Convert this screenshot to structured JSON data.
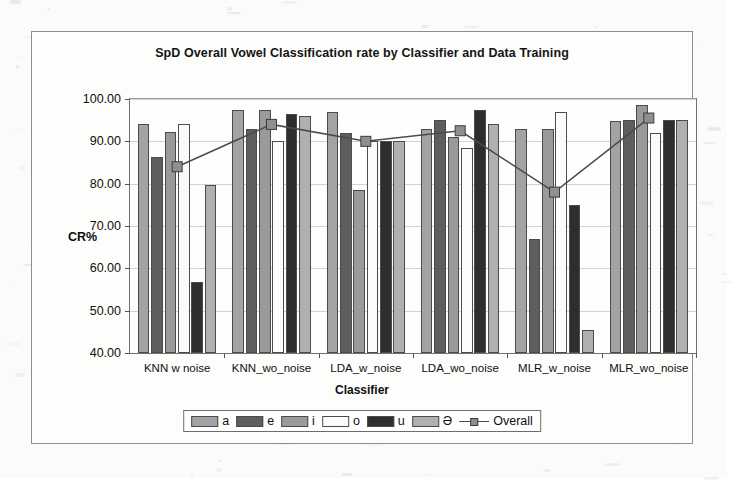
{
  "chart_data": {
    "type": "bar",
    "title": "SpD Overall Vowel Classification rate by Classifier and Data Training",
    "xlabel": "Classifier",
    "ylabel": "CR%",
    "ylim": [
      40,
      100
    ],
    "ytick_step": 10,
    "ytick_labels": [
      "100.00",
      "90.00",
      "80.00",
      "70.00",
      "60.00",
      "50.00",
      "40.00"
    ],
    "ytick_values": [
      100,
      90,
      80,
      70,
      60,
      50,
      40
    ],
    "grid": true,
    "legend_position": "bottom",
    "categories": [
      "KNN w noise",
      "KNN_wo_noise",
      "LDA_w_noise",
      "LDA_wo_noise",
      "MLR_w_noise",
      "MLR_wo_noise"
    ],
    "series": [
      {
        "name": "a",
        "color": "#a3a3a3",
        "type": "bar",
        "values": [
          94.0,
          97.5,
          97.0,
          93.0,
          93.0,
          94.8
        ]
      },
      {
        "name": "e",
        "color": "#5e5e5e",
        "type": "bar",
        "values": [
          86.3,
          93.0,
          92.0,
          95.0,
          67.0,
          95.0
        ]
      },
      {
        "name": "i",
        "color": "#9a9a9a",
        "type": "bar",
        "values": [
          92.3,
          97.5,
          78.5,
          91.0,
          93.0,
          98.5
        ]
      },
      {
        "name": "o",
        "color": "#fbfbfb",
        "type": "bar",
        "values": [
          94.0,
          90.0,
          90.0,
          88.5,
          97.0,
          92.0
        ]
      },
      {
        "name": "u",
        "color": "#2e2e2e",
        "type": "bar",
        "values": [
          56.8,
          96.5,
          90.0,
          97.5,
          75.0,
          95.0
        ]
      },
      {
        "name": "Ə",
        "color": "#b0b0b0",
        "type": "bar",
        "values": [
          79.7,
          96.0,
          90.0,
          94.0,
          45.5,
          95.0
        ]
      },
      {
        "name": "Overall",
        "color": "#8f8f8f",
        "type": "line",
        "values": [
          84.0,
          94.0,
          90.0,
          92.5,
          78.0,
          95.5
        ]
      }
    ]
  }
}
